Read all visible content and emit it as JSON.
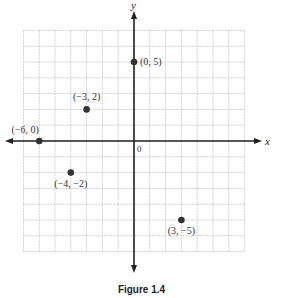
{
  "chart_data": {
    "type": "scatter",
    "title": "",
    "xlabel": "x",
    "ylabel": "y",
    "origin_label": "0",
    "xlim": [
      -7,
      7
    ],
    "ylim": [
      -7,
      7
    ],
    "grid": true,
    "points": [
      {
        "x": 0,
        "y": 5,
        "label": "(0, 5)"
      },
      {
        "x": -3,
        "y": 2,
        "label": "(−3, 2)"
      },
      {
        "x": -6,
        "y": 0,
        "label": "(−6, 0)"
      },
      {
        "x": -4,
        "y": -2,
        "label": "(−4, −2)"
      },
      {
        "x": 3,
        "y": -5,
        "label": "(3, −5)"
      }
    ]
  },
  "caption": "Figure 1.4",
  "colors": {
    "grid": "#c4c4c4",
    "axis": "#222222",
    "point": "#333333"
  }
}
